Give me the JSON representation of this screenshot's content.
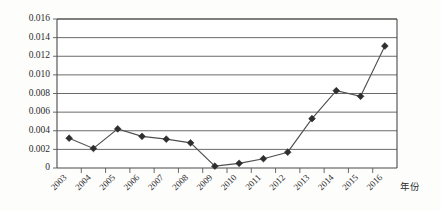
{
  "chart_data": {
    "type": "line",
    "title": "",
    "xlabel": "年份",
    "ylabel": "",
    "categories": [
      "2003",
      "2004",
      "2005",
      "2006",
      "2007",
      "2008",
      "2009",
      "2010",
      "2011",
      "2012",
      "2013",
      "2014",
      "2015",
      "2016"
    ],
    "values": [
      0.0032,
      0.0021,
      0.0042,
      0.0034,
      0.0031,
      0.0027,
      0.0002,
      0.0005,
      0.001,
      0.0017,
      0.0053,
      0.0083,
      0.0077,
      0.0131
    ],
    "series": [
      {
        "name": "",
        "values": [
          0.0032,
          0.0021,
          0.0042,
          0.0034,
          0.0031,
          0.0027,
          0.0002,
          0.0005,
          0.001,
          0.0017,
          0.0053,
          0.0083,
          0.0077,
          0.0131
        ]
      }
    ],
    "ylim": [
      0,
      0.016
    ],
    "ytick_labels": [
      "0.016",
      "0.014",
      "0.012",
      "0.010",
      "0.008",
      "0.006",
      "0.004",
      "0.002",
      "0"
    ],
    "ytick_values": [
      0.016,
      0.014,
      0.012,
      0.01,
      0.008,
      0.006,
      0.004,
      0.002,
      0
    ],
    "ytick_step": 0.002,
    "grid": "horizontal",
    "legend": "none",
    "marker": "diamond",
    "colors": {
      "line": "#4f4f4f",
      "marker": "#2e2e2e",
      "grid": "#595959",
      "frame": "#4a4a4a",
      "text": "#2b2b2b",
      "background": "#fdfdfc"
    },
    "xtick_label_rotation": -45
  }
}
